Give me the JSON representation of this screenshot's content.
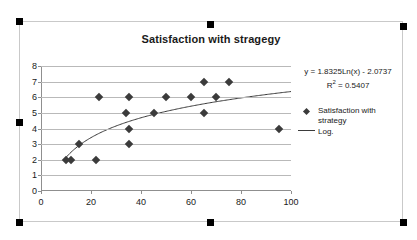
{
  "chart_data": {
    "type": "scatter",
    "title": "Satisfaction with stragegy",
    "xlabel": "",
    "ylabel": "",
    "xlim": [
      0,
      100
    ],
    "ylim": [
      0,
      8
    ],
    "xticks": [
      "0",
      "20",
      "40",
      "60",
      "80",
      "100"
    ],
    "yticks": [
      "0",
      "1",
      "2",
      "3",
      "4",
      "5",
      "6",
      "7",
      "8"
    ],
    "grid": "horizontal",
    "legend_position": "right",
    "series": [
      {
        "name": "Satisfaction with strategy",
        "marker": "diamond",
        "color": "#3b3b3b",
        "points": [
          {
            "x": 10,
            "y": 2
          },
          {
            "x": 12,
            "y": 2
          },
          {
            "x": 15,
            "y": 3
          },
          {
            "x": 22,
            "y": 2
          },
          {
            "x": 23,
            "y": 6
          },
          {
            "x": 34,
            "y": 5
          },
          {
            "x": 35,
            "y": 6
          },
          {
            "x": 35,
            "y": 4
          },
          {
            "x": 35,
            "y": 3
          },
          {
            "x": 45,
            "y": 5
          },
          {
            "x": 50,
            "y": 6
          },
          {
            "x": 60,
            "y": 6
          },
          {
            "x": 65,
            "y": 7
          },
          {
            "x": 65,
            "y": 5
          },
          {
            "x": 70,
            "y": 6
          },
          {
            "x": 75,
            "y": 7
          },
          {
            "x": 95,
            "y": 4
          }
        ]
      },
      {
        "name": "Log.",
        "type": "trendline",
        "fit": "logarithmic",
        "color": "#3b3b3b",
        "a": 1.8325,
        "b": -2.0737
      }
    ],
    "annotations": {
      "equation": "y = 1.8325Ln(x) - 2.0737",
      "r_squared_prefix": "R",
      "r_squared_exponent": "2",
      "r_squared_value": " = 0.5407"
    }
  },
  "legend": {
    "items": [
      {
        "label": "Satisfaction with strategy",
        "key": "diamond"
      },
      {
        "label": "Log.",
        "key": "line"
      }
    ]
  },
  "selection": {
    "handle_color": "#000000"
  }
}
